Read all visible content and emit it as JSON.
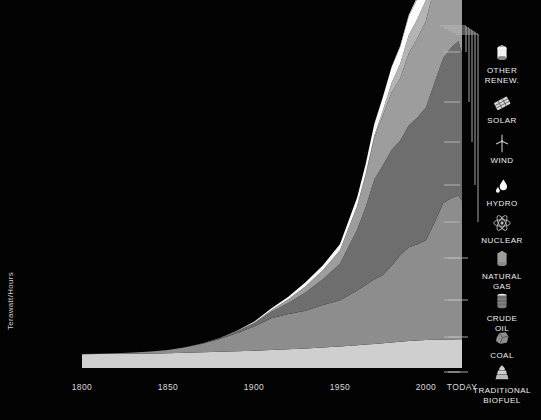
{
  "axes": {
    "y_label": "Terawatt/Hours",
    "y_ticks": [
      "140,000",
      "120,000",
      "100,000",
      "80,000",
      "60,000",
      "40,000",
      "20,000"
    ],
    "x_ticks": [
      "1800",
      "1850",
      "1900",
      "1950",
      "2000",
      "TODAY"
    ]
  },
  "legend": {
    "items": [
      {
        "label": "OTHER\nRENEW.",
        "icon": "canister-icon",
        "color": "#f2f2f2"
      },
      {
        "label": "SOLAR",
        "icon": "solar-panel-icon",
        "color": "#d8d8d8"
      },
      {
        "label": "WIND",
        "icon": "wind-turbine-icon",
        "color": "#c6c6c6"
      },
      {
        "label": "HYDRO",
        "icon": "water-drop-icon",
        "color": "#fbfbfb"
      },
      {
        "label": "NUCLEAR",
        "icon": "atom-icon",
        "color": "#b4b4b4"
      },
      {
        "label": "NATURAL\nGAS",
        "icon": "gas-canister-icon",
        "color": "#9d9d9d"
      },
      {
        "label": "CRUDE\nOIL",
        "icon": "oil-barrel-icon",
        "color": "#6e6e6e"
      },
      {
        "label": "COAL",
        "icon": "coal-lump-icon",
        "color": "#8d8d8d"
      },
      {
        "label": "TRADITIONAL\nBIOFUEL",
        "icon": "wood-log-icon",
        "color": "#cfcfcf"
      }
    ]
  },
  "chart_data": {
    "type": "area",
    "stacked": true,
    "title": "",
    "xlabel": "",
    "ylabel": "Terawatt/Hours",
    "ylim": [
      0,
      145000
    ],
    "xlim": [
      1800,
      2021
    ],
    "grid": false,
    "legend_position": "right",
    "x": [
      1800,
      1810,
      1820,
      1830,
      1840,
      1850,
      1860,
      1870,
      1880,
      1890,
      1900,
      1910,
      1920,
      1930,
      1940,
      1950,
      1960,
      1965,
      1970,
      1975,
      1980,
      1985,
      1990,
      1995,
      2000,
      2005,
      2010,
      2015,
      2019,
      2021
    ],
    "series": [
      {
        "name": "TRADITIONAL BIOFUEL",
        "color": "#cfcfcf",
        "values": [
          5600,
          5700,
          5800,
          5900,
          6000,
          6100,
          6300,
          6500,
          6700,
          6900,
          7100,
          7400,
          7700,
          8000,
          8400,
          8800,
          9300,
          9600,
          9900,
          10200,
          10500,
          10800,
          11100,
          11300,
          11500,
          11600,
          11700,
          11750,
          11800,
          11800
        ]
      },
      {
        "name": "COAL",
        "color": "#8d8d8d",
        "values": [
          100,
          180,
          300,
          500,
          800,
          1300,
          2200,
          3500,
          5200,
          7400,
          9900,
          13000,
          14500,
          15500,
          17500,
          19000,
          22500,
          24500,
          26500,
          28000,
          31500,
          35500,
          38500,
          39500,
          41000,
          48000,
          56000,
          58000,
          59000,
          57000
        ]
      },
      {
        "name": "CRUDE OIL",
        "color": "#6e6e6e",
        "values": [
          0,
          0,
          0,
          0,
          0,
          0,
          50,
          150,
          350,
          700,
          1300,
          2600,
          4500,
          7500,
          10500,
          15000,
          25000,
          32000,
          41000,
          45000,
          47500,
          47000,
          50000,
          52000,
          54500,
          57500,
          59500,
          62000,
          63500,
          60000
        ]
      },
      {
        "name": "NATURAL GAS",
        "color": "#9d9d9d",
        "values": [
          0,
          0,
          0,
          0,
          0,
          0,
          0,
          20,
          60,
          140,
          300,
          700,
          1500,
          2600,
          3700,
          5500,
          9500,
          13000,
          17000,
          20500,
          23500,
          25500,
          29500,
          32500,
          35500,
          39500,
          43500,
          46500,
          49500,
          49000
        ]
      },
      {
        "name": "NUCLEAR",
        "color": "#b4b4b4",
        "values": [
          0,
          0,
          0,
          0,
          0,
          0,
          0,
          0,
          0,
          0,
          0,
          0,
          0,
          0,
          0,
          0,
          200,
          500,
          1000,
          2000,
          4000,
          6000,
          7500,
          8000,
          8500,
          8600,
          8400,
          7800,
          8000,
          8100
        ]
      },
      {
        "name": "HYDRO",
        "color": "#fbfbfb",
        "values": [
          0,
          0,
          0,
          0,
          0,
          0,
          0,
          0,
          50,
          150,
          350,
          700,
          1100,
          1600,
          2000,
          2500,
          3500,
          4200,
          4800,
          5600,
          6400,
          7000,
          7700,
          8200,
          8800,
          9500,
          10500,
          11200,
          11800,
          12000
        ]
      },
      {
        "name": "WIND",
        "color": "#c6c6c6",
        "values": [
          0,
          0,
          0,
          0,
          0,
          0,
          0,
          0,
          0,
          0,
          0,
          0,
          0,
          0,
          0,
          0,
          0,
          0,
          0,
          0,
          0,
          10,
          40,
          100,
          250,
          550,
          1000,
          2200,
          3500,
          4000
        ]
      },
      {
        "name": "SOLAR",
        "color": "#d8d8d8",
        "values": [
          0,
          0,
          0,
          0,
          0,
          0,
          0,
          0,
          0,
          0,
          0,
          0,
          0,
          0,
          0,
          0,
          0,
          0,
          0,
          0,
          0,
          0,
          5,
          15,
          30,
          80,
          250,
          1000,
          2200,
          2700
        ]
      },
      {
        "name": "OTHER RENEW.",
        "color": "#f2f2f2",
        "values": [
          0,
          0,
          0,
          0,
          0,
          0,
          0,
          0,
          0,
          0,
          0,
          0,
          0,
          0,
          0,
          0,
          0,
          20,
          50,
          100,
          200,
          350,
          550,
          800,
          1100,
          1500,
          2000,
          2600,
          3100,
          3300
        ]
      }
    ]
  }
}
